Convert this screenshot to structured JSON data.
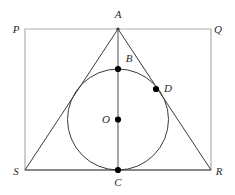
{
  "figure": {
    "canvas": {
      "width": 235,
      "height": 195
    },
    "colors": {
      "background": "#ffffff",
      "rectangle_stroke": "#b0b0b0",
      "triangle_stroke": "#3a3a3a",
      "circle_stroke": "#3a3a3a",
      "axis_stroke": "#6e6e6e",
      "point_fill": "#000000",
      "label_fill": "#2b2b2b"
    },
    "stroke_widths": {
      "rectangle": 1.2,
      "triangle": 1.0,
      "circle": 1.0,
      "axis": 1.2
    }
  },
  "rectangle": {
    "name": "PQRS",
    "corners": [
      {
        "label": "P",
        "x": 25,
        "y": 29,
        "label_x": 16,
        "label_y": 33
      },
      {
        "label": "Q",
        "x": 211,
        "y": 29,
        "label_x": 216,
        "label_y": 33
      },
      {
        "label": "R",
        "x": 211,
        "y": 170,
        "label_x": 216,
        "label_y": 175
      },
      {
        "label": "S",
        "x": 25,
        "y": 170,
        "label_x": 14,
        "label_y": 175
      }
    ]
  },
  "triangle": {
    "name": "ASR",
    "vertices": [
      {
        "label": "A",
        "x": 118,
        "y": 29,
        "label_x": 118,
        "label_y": 18
      },
      {
        "label": "S",
        "x": 25,
        "y": 170
      },
      {
        "label": "R",
        "x": 211,
        "y": 170
      }
    ],
    "path": "M 118 29 L 25 170 L 211 170 Z"
  },
  "circle": {
    "name": "inscribed-circle",
    "center": {
      "x": 118,
      "y": 119.5
    },
    "radius": 50.5
  },
  "axis_segment": {
    "name": "segment-AC",
    "from": {
      "x": 118,
      "y": 29
    },
    "to": {
      "x": 118,
      "y": 170
    }
  },
  "points": [
    {
      "label": "B",
      "x": 118,
      "y": 69,
      "label_x": 129,
      "label_y": 62,
      "radius": 3.1,
      "note": "top tangent point of circle on AC"
    },
    {
      "label": "D",
      "x": 156,
      "y": 89,
      "label_x": 168,
      "label_y": 92,
      "radius": 3.1,
      "note": "tangent point on side AR"
    },
    {
      "label": "O",
      "x": 118,
      "y": 119.5,
      "label_x": 106,
      "label_y": 123,
      "radius": 3.1,
      "note": "center of circle"
    },
    {
      "label": "C",
      "x": 118,
      "y": 170,
      "label_x": 118,
      "label_y": 186,
      "radius": 3.1,
      "note": "tangent point on base SR"
    }
  ]
}
